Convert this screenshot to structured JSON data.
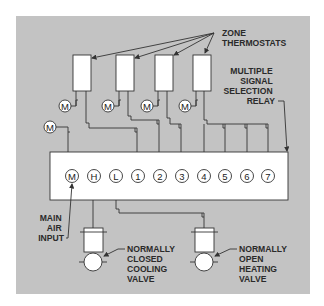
{
  "colors": {
    "background": "#ffffff",
    "panel": "#c3c3c3",
    "component_fill": "#ffffff",
    "line": "#333333",
    "text": "#2a2a2a"
  },
  "labels": {
    "zone_thermostats": [
      "ZONE",
      "THERMOSTATS"
    ],
    "relay": [
      "MULTIPLE",
      "SIGNAL",
      "SELECTION",
      "RELAY"
    ],
    "main_air_input": [
      "MAIN",
      "AIR",
      "INPUT"
    ],
    "cooling_valve": [
      "NORMALLY",
      "CLOSED",
      "COOLING",
      "VALVE"
    ],
    "heating_valve": [
      "NORMALLY",
      "OPEN",
      "HEATING",
      "VALVE"
    ]
  },
  "relay_ports": [
    "M",
    "H",
    "L",
    "1",
    "2",
    "3",
    "4",
    "5",
    "6",
    "7"
  ],
  "thermostat_main_air_symbol": "M",
  "extra_main_air_symbol": "M",
  "thermostat_count": 4
}
